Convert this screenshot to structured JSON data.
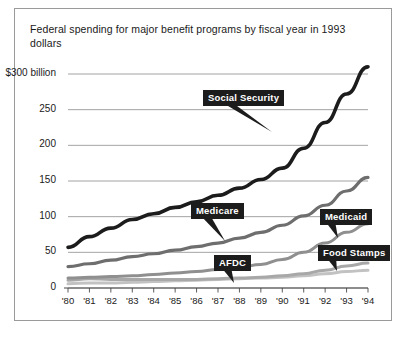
{
  "chart_data": {
    "type": "line",
    "title": "Federal spending for major benefit programs by fiscal year in 1993 dollars",
    "xlabel": "",
    "ylabel": "",
    "ylim": [
      0,
      300
    ],
    "yticks": [
      0,
      50,
      100,
      150,
      200,
      250,
      300
    ],
    "ytick_labels": [
      "0",
      "50",
      "100",
      "150",
      "200",
      "250",
      "$300 billion"
    ],
    "x": [
      "'80",
      "'81",
      "'82",
      "'83",
      "'84",
      "'85",
      "'86",
      "'87",
      "'88",
      "'89",
      "'90",
      "'91",
      "'92",
      "'93",
      "'94"
    ],
    "grid": true,
    "legend": "inline-callouts",
    "series": [
      {
        "name": "Social Security",
        "color": "#1c1c1c",
        "values": [
          57,
          72,
          84,
          96,
          104,
          113,
          121,
          130,
          140,
          152,
          168,
          196,
          232,
          272,
          310
        ]
      },
      {
        "name": "Medicare",
        "color": "#6e6e6e",
        "values": [
          30,
          34,
          39,
          44,
          48,
          53,
          58,
          63,
          70,
          78,
          88,
          101,
          116,
          136,
          155
        ]
      },
      {
        "name": "Medicaid",
        "color": "#8f8f8f",
        "values": [
          14,
          15,
          16,
          17,
          19,
          21,
          23,
          26,
          29,
          33,
          40,
          50,
          63,
          78,
          90
        ]
      },
      {
        "name": "Food Stamps",
        "color": "#a8a8a8",
        "values": [
          11,
          13,
          12,
          12,
          12,
          12,
          12,
          13,
          14,
          15,
          17,
          20,
          25,
          31,
          35
        ]
      },
      {
        "name": "AFDC",
        "color": "#c2c2c2",
        "values": [
          6,
          7,
          7,
          8,
          9,
          10,
          11,
          12,
          13,
          14,
          15,
          17,
          20,
          23,
          25
        ]
      }
    ],
    "callouts": [
      {
        "label": "Social Security",
        "series": "Social Security"
      },
      {
        "label": "Medicare",
        "series": "Medicare"
      },
      {
        "label": "Medicaid",
        "series": "Medicaid"
      },
      {
        "label": "Food Stamps",
        "series": "Food Stamps"
      },
      {
        "label": "AFDC",
        "series": "AFDC"
      }
    ]
  }
}
